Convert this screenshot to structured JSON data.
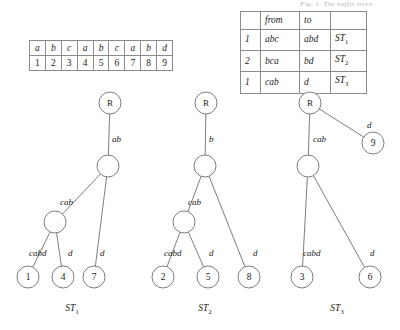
{
  "caption_fragment": {
    "text": "Fig. 1. The suffix trees"
  },
  "sequence_table": {
    "symbols": [
      "a",
      "b",
      "c",
      "a",
      "b",
      "c",
      "a",
      "b",
      "d"
    ],
    "indices": [
      "1",
      "2",
      "3",
      "4",
      "5",
      "6",
      "7",
      "8",
      "9"
    ]
  },
  "transitions_table": {
    "headers": [
      "",
      "from",
      "to",
      ""
    ],
    "rows": [
      {
        "count": "1",
        "from": "abc",
        "to": "abd",
        "tree": "ST",
        "tree_sub": "1"
      },
      {
        "count": "2",
        "from": "bca",
        "to": "bd",
        "tree": "ST",
        "tree_sub": "2"
      },
      {
        "count": "1",
        "from": "cab",
        "to": "d",
        "tree": "ST",
        "tree_sub": "3"
      }
    ]
  },
  "trees": [
    {
      "caption": "ST",
      "caption_sub": "1",
      "root_label": "R",
      "nodes": [
        {
          "id": "r",
          "label": "R",
          "x": 110,
          "y": 103,
          "r": 11
        },
        {
          "id": "n1",
          "label": "",
          "x": 108,
          "y": 166,
          "r": 11
        },
        {
          "id": "n2",
          "label": "",
          "x": 55,
          "y": 222,
          "r": 11
        },
        {
          "id": "l1",
          "label": "1",
          "x": 28,
          "y": 277,
          "r": 11
        },
        {
          "id": "l4",
          "label": "4",
          "x": 63,
          "y": 277,
          "r": 11
        },
        {
          "id": "l7",
          "label": "7",
          "x": 94,
          "y": 277,
          "r": 11
        }
      ],
      "edges": [
        {
          "from": "r",
          "to": "n1",
          "label": "ab",
          "lx": 112,
          "ly": 142
        },
        {
          "from": "n1",
          "to": "n2",
          "label": "cab",
          "lx": 60,
          "ly": 205
        },
        {
          "from": "n2",
          "to": "l1",
          "label": "cabd",
          "lx": 29,
          "ly": 256
        },
        {
          "from": "n2",
          "to": "l4",
          "label": "d",
          "lx": 68,
          "ly": 256
        },
        {
          "from": "n1",
          "to": "l7",
          "label": "d",
          "lx": 100,
          "ly": 256
        }
      ]
    },
    {
      "caption": "ST",
      "caption_sub": "2",
      "root_label": "R",
      "nodes": [
        {
          "id": "r",
          "label": "R",
          "x": 206,
          "y": 103,
          "r": 11
        },
        {
          "id": "n1",
          "label": "",
          "x": 205,
          "y": 166,
          "r": 11
        },
        {
          "id": "n2",
          "label": "",
          "x": 184,
          "y": 222,
          "r": 11
        },
        {
          "id": "l2",
          "label": "2",
          "x": 163,
          "y": 277,
          "r": 11
        },
        {
          "id": "l5",
          "label": "5",
          "x": 208,
          "y": 277,
          "r": 11
        },
        {
          "id": "l8",
          "label": "8",
          "x": 249,
          "y": 277,
          "r": 11
        }
      ],
      "edges": [
        {
          "from": "r",
          "to": "n1",
          "label": "b",
          "lx": 209,
          "ly": 142
        },
        {
          "from": "n1",
          "to": "n2",
          "label": "cab",
          "lx": 188,
          "ly": 205
        },
        {
          "from": "n2",
          "to": "l2",
          "label": "cabd",
          "lx": 164,
          "ly": 256
        },
        {
          "from": "n2",
          "to": "l5",
          "label": "d",
          "lx": 209,
          "ly": 256
        },
        {
          "from": "n1",
          "to": "l8",
          "label": "d",
          "lx": 253,
          "ly": 256
        }
      ]
    },
    {
      "caption": "ST",
      "caption_sub": "3",
      "root_label": "R",
      "nodes": [
        {
          "id": "r",
          "label": "R",
          "x": 310,
          "y": 103,
          "r": 11
        },
        {
          "id": "n1",
          "label": "",
          "x": 308,
          "y": 166,
          "r": 11
        },
        {
          "id": "l9",
          "label": "9",
          "x": 373,
          "y": 143,
          "r": 11
        },
        {
          "id": "l3",
          "label": "3",
          "x": 302,
          "y": 277,
          "r": 11
        },
        {
          "id": "l6",
          "label": "6",
          "x": 370,
          "y": 277,
          "r": 11
        }
      ],
      "edges": [
        {
          "from": "r",
          "to": "n1",
          "label": "cab",
          "lx": 313,
          "ly": 142
        },
        {
          "from": "r",
          "to": "l9",
          "label": "d",
          "lx": 367,
          "ly": 128
        },
        {
          "from": "n1",
          "to": "l3",
          "label": "cabd",
          "lx": 303,
          "ly": 256
        },
        {
          "from": "n1",
          "to": "l6",
          "label": "d",
          "lx": 370,
          "ly": 256
        }
      ]
    }
  ],
  "tree_captions": [
    {
      "text": "ST",
      "sub": "1",
      "x": 72,
      "y": 311
    },
    {
      "text": "ST",
      "sub": "2",
      "x": 205,
      "y": 311
    },
    {
      "text": "ST",
      "sub": "3",
      "x": 337,
      "y": 311
    }
  ],
  "colors": {
    "stroke": "#6e6e6e",
    "table_border": "#8c8c8c",
    "text": "#1a1a1a",
    "background": "#ffffff"
  }
}
